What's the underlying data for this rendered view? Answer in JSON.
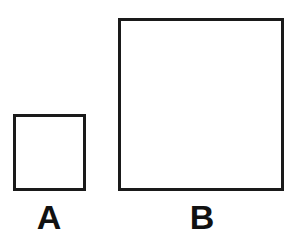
{
  "diagram": {
    "background_color": "#ffffff",
    "stroke_color": "#1a1a1a",
    "fill_color": "#ffffff",
    "label_color": "#111111",
    "figures": [
      {
        "id": "a",
        "label": "A",
        "shape": "square",
        "x": 13,
        "y": 114,
        "width": 73,
        "height": 77,
        "stroke_width": 3,
        "label_x": 49,
        "label_y": 215
      },
      {
        "id": "b",
        "label": "B",
        "shape": "square",
        "x": 118,
        "y": 18,
        "width": 166,
        "height": 173,
        "stroke_width": 3,
        "label_x": 202,
        "label_y": 215
      }
    ]
  },
  "chart_data": {
    "type": "bar",
    "categories": [
      "A",
      "B"
    ],
    "values": [
      73,
      166
    ],
    "xlabel": "",
    "ylabel": "Side length (px)",
    "ylim": [
      0,
      180
    ],
    "grid": false,
    "legend": "none",
    "annotations": [
      "Square A side approximately 73 px",
      "Square B side approximately 166 px",
      "Both squares share a common bottom baseline"
    ]
  }
}
